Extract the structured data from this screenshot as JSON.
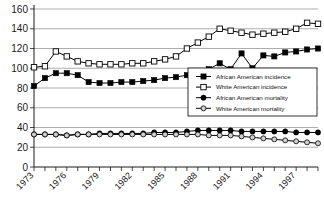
{
  "chart_data": {
    "type": "line",
    "title": "",
    "xlabel": "",
    "ylabel": "",
    "ylim": [
      0,
      160
    ],
    "ytick_step": 20,
    "yticks": [
      "0",
      "20",
      "40",
      "60",
      "80",
      "100",
      "120",
      "140",
      "160"
    ],
    "grid": true,
    "grid_axis": "y",
    "legend_position": "middle-right",
    "x": [
      1973,
      1974,
      1975,
      1976,
      1977,
      1978,
      1979,
      1980,
      1981,
      1982,
      1983,
      1984,
      1985,
      1986,
      1987,
      1988,
      1989,
      1990,
      1991,
      1992,
      1993,
      1994,
      1995,
      1996,
      1997,
      1998,
      1999
    ],
    "xtick_labels": [
      "1973",
      "1976",
      "1979",
      "1982",
      "1985",
      "1988",
      "1991",
      "1994",
      "1997"
    ],
    "xtick_label_years": [
      1973,
      1976,
      1979,
      1982,
      1985,
      1988,
      1991,
      1994,
      1997
    ],
    "series": [
      {
        "name": "African American incidence",
        "marker": "filled-square",
        "values": [
          82,
          90,
          95,
          95,
          93,
          86,
          85,
          85,
          86,
          86,
          87,
          88,
          90,
          91,
          93,
          94,
          99,
          105,
          99,
          115,
          100,
          113,
          112,
          116,
          117,
          119,
          120
        ]
      },
      {
        "name": "White American incidence",
        "marker": "open-square",
        "values": [
          101,
          102,
          117,
          112,
          107,
          105,
          104,
          104,
          104,
          105,
          105,
          107,
          109,
          112,
          120,
          126,
          132,
          140,
          138,
          136,
          134,
          135,
          136,
          137,
          140,
          146,
          145
        ]
      },
      {
        "name": "African American mortality",
        "marker": "filled-circle",
        "values": [
          33,
          33,
          33,
          32,
          33,
          33,
          34,
          34,
          34,
          34,
          34,
          35,
          35,
          35,
          36,
          37,
          37,
          37,
          37,
          36,
          36,
          36,
          36,
          36,
          35,
          35,
          35
        ]
      },
      {
        "name": "White American mortality",
        "marker": "gray-circle",
        "values": [
          33,
          33,
          33,
          32,
          33,
          33,
          33,
          33,
          33,
          33,
          33,
          33,
          33,
          33,
          33,
          33,
          32,
          32,
          32,
          31,
          30,
          29,
          28,
          27,
          26,
          25,
          24
        ]
      }
    ]
  },
  "legend": {
    "entries": [
      {
        "label": "African American incidence"
      },
      {
        "label": "White American incidence"
      },
      {
        "label": "African American mortality"
      },
      {
        "label": "White American mortality"
      }
    ]
  }
}
